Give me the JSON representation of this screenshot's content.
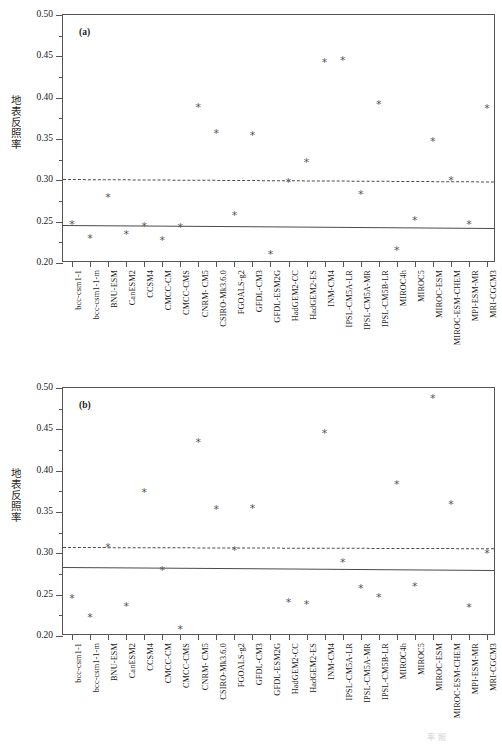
{
  "figure": {
    "ylabel": "地表反照率",
    "models": [
      "bcc-csm1-1",
      "bcc-csm1-1-m",
      "BNU-ESM",
      "CanESM2",
      "CCSM4",
      "CMCC-CM",
      "CMCC-CMS",
      "CNRM- CM5",
      "CSIRO-Mk3.6.0",
      "FGOALS-g2",
      "GFDL-CM3",
      "GFDL-ESM2G",
      "HadGEM2-CC",
      "HadGEM2-ES",
      "INM-CM4",
      "IPSL-CM5A-LR",
      "IPSL-CM5A-MR",
      "IPSL-CM5B-LR",
      "MIROC4h",
      "MIROC5",
      "MIROC-ESM",
      "MIROC-ESM-CHEM",
      "MPI-ESM-MR",
      "MRI-CGCM3"
    ],
    "yticks": [
      "0.20",
      "0.25",
      "0.30",
      "0.35",
      "0.40",
      "0.45",
      "0.50"
    ],
    "ytick_values": [
      0.2,
      0.25,
      0.3,
      0.35,
      0.4,
      0.45,
      0.5
    ],
    "yminor_values": [
      0.225,
      0.275,
      0.325,
      0.375,
      0.425,
      0.475
    ]
  },
  "chart_data": [
    {
      "type": "scatter",
      "panel": "(a)",
      "title": "",
      "xlabel": "",
      "ylabel": "地表反照率",
      "ylim": [
        0.2,
        0.5
      ],
      "grid": false,
      "legend": "none",
      "marker": "*",
      "categories": [
        "bcc-csm1-1",
        "bcc-csm1-1-m",
        "BNU-ESM",
        "CanESM2",
        "CCSM4",
        "CMCC-CM",
        "CMCC-CMS",
        "CNRM- CM5",
        "CSIRO-Mk3.6.0",
        "FGOALS-g2",
        "GFDL-CM3",
        "GFDL-ESM2G",
        "HadGEM2-CC",
        "HadGEM2-ES",
        "INM-CM4",
        "IPSL-CM5A-LR",
        "IPSL-CM5A-MR",
        "IPSL-CM5B-LR",
        "MIROC4h",
        "MIROC5",
        "MIROC-ESM",
        "MIROC-ESM-CHEM",
        "MPI-ESM-MR",
        "MRI-CGCM3"
      ],
      "values": [
        0.247,
        0.23,
        0.279,
        0.235,
        0.244,
        0.227,
        0.243,
        0.388,
        0.357,
        0.258,
        0.354,
        0.21,
        0.297,
        0.322,
        0.442,
        0.445,
        0.283,
        0.392,
        0.215,
        0.252,
        0.347,
        0.3,
        0.246,
        0.387
      ],
      "reference_lines": [
        {
          "name": "model-mean-line",
          "style": "solid",
          "y_left": 0.2465,
          "y_right": 0.243
        },
        {
          "name": "observation-mean-line",
          "style": "dashed",
          "y_left": 0.3015,
          "y_right": 0.2985
        }
      ]
    },
    {
      "type": "scatter",
      "panel": "(b)",
      "title": "",
      "xlabel": "",
      "ylabel": "地表反照率",
      "ylim": [
        0.2,
        0.5
      ],
      "grid": false,
      "legend": "none",
      "marker": "*",
      "categories": [
        "bcc-csm1-1",
        "bcc-csm1-1-m",
        "BNU-ESM",
        "CanESM2",
        "CCSM4",
        "CMCC-CM",
        "CMCC-CMS",
        "CNRM- CM5",
        "CSIRO-Mk3.6.0",
        "FGOALS-g2",
        "GFDL-CM3",
        "GFDL-ESM2G",
        "HadGEM2-CC",
        "HadGEM2-ES",
        "INM-CM4",
        "IPSL-CM5A-LR",
        "IPSL-CM5A-MR",
        "IPSL-CM5B-LR",
        "MIROC4h",
        "MIROC5",
        "MIROC-ESM",
        "MIROC-ESM-CHEM",
        "MPI-ESM-MR",
        "MRI-CGCM3"
      ],
      "values": [
        0.245,
        0.222,
        0.307,
        0.236,
        0.374,
        0.279,
        0.208,
        0.434,
        0.353,
        0.304,
        0.354,
        null,
        0.241,
        0.238,
        0.445,
        0.289,
        0.258,
        0.246,
        0.383,
        0.26,
        0.487,
        0.359,
        0.235,
        0.3
      ],
      "reference_lines": [
        {
          "name": "model-mean-line",
          "style": "solid",
          "y_left": 0.2835,
          "y_right": 0.28
        },
        {
          "name": "observation-mean-line",
          "style": "dashed",
          "y_left": 0.308,
          "y_right": 0.3065
        }
      ]
    }
  ]
}
